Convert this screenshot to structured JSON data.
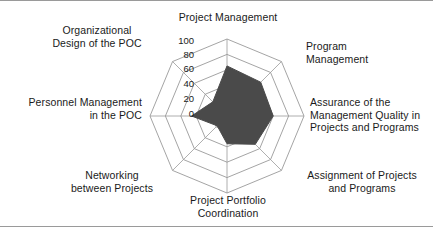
{
  "chart_data": {
    "type": "radar",
    "title": "",
    "categories": [
      "Project Management",
      "Program Management",
      "Assurance of the Management Quality in Projects and Programs",
      "Assignment of Projects and Programs",
      "Project Portfolio Coordination",
      "Networking between Projects",
      "Personnel Management in the POC",
      "Organizational Design of the POC"
    ],
    "values": [
      65,
      62,
      60,
      52,
      36,
      18,
      46,
      26
    ],
    "rmin": 0,
    "rmax": 100,
    "tick_values": [
      100,
      80,
      60,
      40,
      20,
      0
    ],
    "tick_labels": [
      "100",
      "80",
      "60",
      "40",
      "20",
      "0"
    ],
    "grid": true,
    "legend": "none",
    "xlabel": "",
    "ylabel": "",
    "fill_color": "#4a4a4a",
    "grid_color": "#9a9a9a",
    "text_color": "#1a1a1a"
  },
  "labels": {
    "top": "Project Management",
    "top_right": "Program\nManagement",
    "right": "Assurance of the\nManagement Quality in\nProjects and Programs",
    "bottom_right": "Assignment of Projects\nand Programs",
    "bottom": "Project Portfolio\nCoordination",
    "bottom_left": "Networking\nbetween Projects",
    "left": "Personnel Management\nin the POC",
    "top_left": "Organizational\nDesign of the POC"
  },
  "ticks": {
    "t100": "100",
    "t80": "80",
    "t60": "60",
    "t40": "40",
    "t20": "20",
    "t0": "0"
  }
}
